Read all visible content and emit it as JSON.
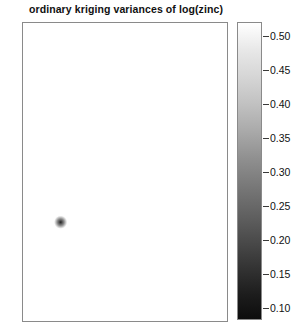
{
  "plot": {
    "title": "ordinary kriging variances of log(zinc)",
    "background_color": "#ffffff",
    "frame_color": "#8a8a8a"
  },
  "legend": {
    "orientation": "vertical",
    "min_label": "0.10",
    "max_label": "0.50",
    "ticks": [
      {
        "label": "0.50",
        "value": 0.5
      },
      {
        "label": "0.45",
        "value": 0.45
      },
      {
        "label": "0.40",
        "value": 0.4
      },
      {
        "label": "0.35",
        "value": 0.35
      },
      {
        "label": "0.30",
        "value": 0.3
      },
      {
        "label": "0.25",
        "value": 0.25
      },
      {
        "label": "0.20",
        "value": 0.2
      },
      {
        "label": "0.15",
        "value": 0.15
      },
      {
        "label": "0.10",
        "value": 0.1
      }
    ],
    "colors": {
      "high": "#ffffff",
      "mid": "#8f8f8f",
      "low": "#0d0d0d"
    }
  },
  "chart_data": {
    "type": "heatmap",
    "title": "ordinary kriging variances of log(zinc)",
    "xlabel": "",
    "ylabel": "",
    "variable": "ordinary kriging variance of log(zinc)",
    "colormap": "grayscale (white = high variance, black = low variance)",
    "zlim": [
      0.08,
      0.52
    ],
    "colorbar_ticks": [
      0.1,
      0.15,
      0.2,
      0.25,
      0.3,
      0.35,
      0.4,
      0.45,
      0.5
    ],
    "grid": false,
    "axes_visible": false,
    "legend_position": "right",
    "domain_shape": "irregular river floodplain polygon (Meuse study area), running from upper-right to lower-left with a narrow tail extending to the lower-right",
    "field_description": "Interpolated kriging variance surface: values are lowest (dark, ~0.08-0.15) near the 155 sample locations scattered throughout the polygon, rising (lighter grey, up to ~0.50) toward the polygon edges and in sparsely sampled gaps.",
    "value_range_observed": [
      0.08,
      0.52
    ],
    "n_sample_points": 155,
    "polygon_outline_xy": [
      [
        0.52,
        0.0
      ],
      [
        0.62,
        0.02
      ],
      [
        0.72,
        0.06
      ],
      [
        0.82,
        0.12
      ],
      [
        0.9,
        0.2
      ],
      [
        0.95,
        0.3
      ],
      [
        0.97,
        0.42
      ],
      [
        0.96,
        0.52
      ],
      [
        0.92,
        0.6
      ],
      [
        0.86,
        0.66
      ],
      [
        0.79,
        0.7
      ],
      [
        0.72,
        0.72
      ],
      [
        0.7,
        0.76
      ],
      [
        0.74,
        0.8
      ],
      [
        0.8,
        0.82
      ],
      [
        0.88,
        0.84
      ],
      [
        0.95,
        0.86
      ],
      [
        0.99,
        0.89
      ],
      [
        0.96,
        0.92
      ],
      [
        0.88,
        0.92
      ],
      [
        0.78,
        0.9
      ],
      [
        0.68,
        0.87
      ],
      [
        0.6,
        0.86
      ],
      [
        0.54,
        0.9
      ],
      [
        0.5,
        0.96
      ],
      [
        0.44,
        0.99
      ],
      [
        0.34,
        1.0
      ],
      [
        0.22,
        0.99
      ],
      [
        0.12,
        0.96
      ],
      [
        0.05,
        0.9
      ],
      [
        0.02,
        0.82
      ],
      [
        0.02,
        0.74
      ],
      [
        0.06,
        0.66
      ],
      [
        0.12,
        0.58
      ],
      [
        0.2,
        0.5
      ],
      [
        0.28,
        0.42
      ],
      [
        0.34,
        0.34
      ],
      [
        0.4,
        0.24
      ],
      [
        0.45,
        0.14
      ],
      [
        0.49,
        0.06
      ]
    ]
  }
}
